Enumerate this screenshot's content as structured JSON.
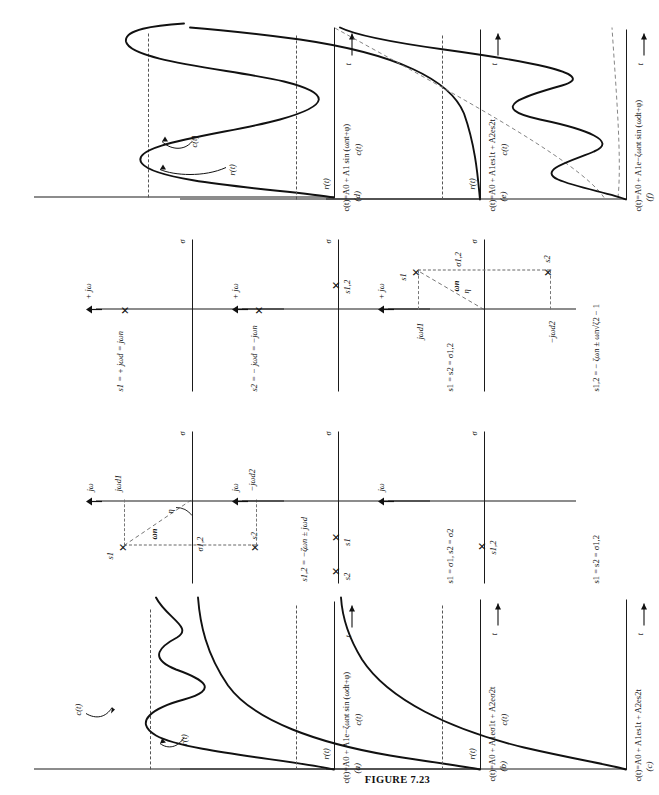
{
  "figure": {
    "caption": "FIGURE 7.23",
    "orientation_deg": -90
  },
  "axis_labels": {
    "sigma": "σ",
    "jomega": "jω",
    "plus_jomega": "+ jω",
    "time": "t",
    "c_of_t": "c(t)",
    "r_of_t": "r(t)",
    "omega_n": "ωn",
    "theta": "η",
    "sigma_12": "σ1,2",
    "jwd1": "jωd1",
    "jwd2": "−jωd2",
    "jwd_pos": "+ jωd = jωn",
    "jwd_neg": "− jωd = −jωn",
    "s1": "s1",
    "s2": "s2"
  },
  "panels": [
    {
      "id": "(a)",
      "pole_plot": {
        "type": "complex-conjugate-pair-lhp",
        "pole_equation": "s1,2 = −ζωn ± jωd",
        "poles": [
          {
            "label": "s1",
            "re": -0.55,
            "im": 0.62
          },
          {
            "label": "s2",
            "re": -0.55,
            "im": -0.62
          }
        ],
        "annotations": [
          "ωn",
          "η",
          "σ1,2",
          "jωd1",
          "−jωd2"
        ]
      },
      "response": {
        "type": "damped-sinusoid",
        "equation": "c(t)=A0 + A1e−ζωnt sin (ωdt+φ)",
        "curve_label": "c(t)",
        "reference_label": "r(t)",
        "x_axis": "t",
        "y_axis": "c"
      }
    },
    {
      "id": "(b)",
      "pole_plot": {
        "type": "two-real-poles-lhp",
        "pole_equation": "s1 = σ1, s2 = σ2",
        "poles": [
          {
            "label": "s1",
            "re": -0.4,
            "im": 0
          },
          {
            "label": "s2",
            "re": -0.8,
            "im": 0
          }
        ],
        "annotations": []
      },
      "response": {
        "type": "overdamped-exponential",
        "equation": "c(t)=A0 + A1eσ1t + A2eσ2t",
        "curve_label": "c(t)",
        "reference_label": "r(t)",
        "x_axis": "t",
        "y_axis": "c"
      }
    },
    {
      "id": "(c)",
      "pole_plot": {
        "type": "repeated-real-pole-lhp",
        "pole_equation": "s1 = s2 = σ1,2",
        "poles": [
          {
            "label": "s1,2",
            "re": -0.5,
            "im": 0
          }
        ],
        "annotations": []
      },
      "response": {
        "type": "critically-damped-exponential",
        "equation": "c(t)=A0 + A1es1t + A2es2t",
        "curve_label": "c(t)",
        "reference_label": "r(t)",
        "x_axis": "t",
        "y_axis": "c"
      }
    },
    {
      "id": "(d)",
      "pole_plot": {
        "type": "imaginary-axis-pair",
        "pole_equation_1": "s1 = + jωd = jωn",
        "pole_equation_2": "s2 = − jωd = −jωn",
        "poles": [
          {
            "label": "s1",
            "re": 0,
            "im": 0.62
          },
          {
            "label": "s2",
            "re": 0,
            "im": -0.62
          }
        ],
        "annotations": []
      },
      "response": {
        "type": "undamped-sinusoid",
        "equation": "c(t)=A0 + A1 sin (ωnt+φ)",
        "curve_label": "c(t)",
        "reference_label": "r(t)",
        "x_axis": "t",
        "y_axis": "c"
      }
    },
    {
      "id": "(e)",
      "pole_plot": {
        "type": "real-pole-rhp",
        "pole_equation": "s1 = s2 = σ1,2",
        "poles": [
          {
            "label": "s1,2",
            "re": 0.3,
            "im": 0
          }
        ],
        "annotations": []
      },
      "response": {
        "type": "growing-exponential",
        "equation": "c(t)=A0 + A1es1t + A2es2t",
        "curve_label": "c(t)",
        "reference_label": "r(t)",
        "x_axis": "t",
        "y_axis": "c"
      }
    },
    {
      "id": "(f)",
      "pole_plot": {
        "type": "complex-conjugate-pair-rhp",
        "pole_equation": "s1,2 = − ζωn ± ωn√ζ2 − 1",
        "poles": [
          {
            "label": "s1",
            "re": 0.45,
            "im": 0.6
          },
          {
            "label": "s2",
            "re": 0.45,
            "im": -0.6
          }
        ],
        "annotations": []
      },
      "response": {
        "type": "growing-oscillation",
        "equation": "c(t)=A0 + A1e−ζωnt sin (ωdt+φ)",
        "curve_label": "c(t)",
        "reference_label": "r(t)",
        "x_axis": "t",
        "y_axis": "c"
      }
    }
  ]
}
